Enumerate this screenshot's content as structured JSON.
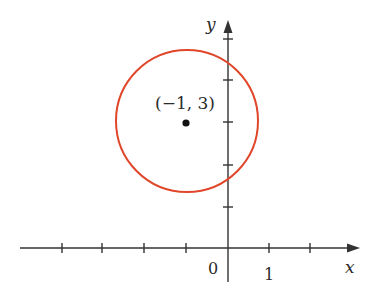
{
  "diagram": {
    "type": "circle-on-axes",
    "axes": {
      "x_label": "x",
      "y_label": "y",
      "origin_label": "0",
      "x_unit_label": "1",
      "x_ticks": [
        -4,
        -3,
        -2,
        -1,
        1,
        2
      ],
      "y_ticks": [
        1,
        2,
        3,
        4,
        5
      ]
    },
    "circle": {
      "center": [
        -1,
        3
      ],
      "center_label": "(−1, 3)",
      "color": "#e0462a"
    },
    "colors": {
      "axis": "#333333",
      "circle": "#e0462a",
      "point": "#111111"
    }
  }
}
